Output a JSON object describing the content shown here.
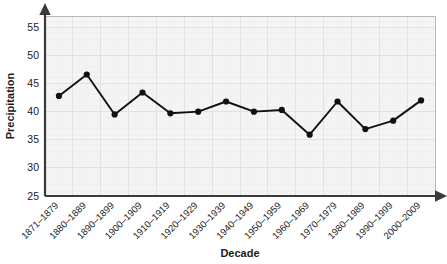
{
  "chart_data": {
    "type": "line",
    "title": "",
    "xlabel": "Decade",
    "ylabel": "Precipitation",
    "categories": [
      "1871–1879",
      "1880–1889",
      "1890–1899",
      "1900–1909",
      "1910–1919",
      "1920–1929",
      "1930–1939",
      "1940–1949",
      "1950–1959",
      "1960–1969",
      "1970–1979",
      "1980–1989",
      "1990–1999",
      "2000–2009"
    ],
    "values": [
      42.8,
      46.6,
      39.5,
      43.4,
      39.7,
      40.0,
      41.8,
      40.0,
      40.3,
      35.9,
      41.8,
      36.9,
      38.4,
      42.0
    ],
    "ylim": [
      25,
      57
    ],
    "yticks": [
      25,
      30,
      35,
      40,
      45,
      50,
      55
    ],
    "ytick_labels": [
      "25",
      "30",
      "35",
      "40",
      "45",
      "50",
      "55"
    ],
    "grid": true,
    "legend": "none",
    "series_name": "Precipitation",
    "marker": "circle",
    "line_color": "#111111",
    "marker_color": "#111111",
    "plot_background": "#f4f4f4",
    "grid_color": "#e2e2e2",
    "axis_color": "#3a3a3a"
  }
}
